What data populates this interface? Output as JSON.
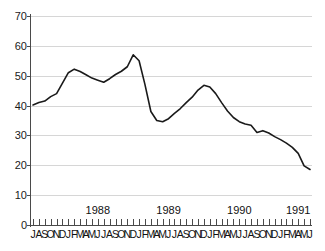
{
  "chart_data": {
    "type": "line",
    "title": "",
    "xlabel": "",
    "ylabel": "",
    "ylim": [
      0,
      70
    ],
    "yticks": [
      0,
      10,
      20,
      30,
      40,
      50,
      60,
      70
    ],
    "grid": true,
    "legend": "none",
    "line_color": "#1a1a1a",
    "gridline_color": "#d6d6d6",
    "axis_color": "#4a4a4a",
    "x": [
      "1987-07",
      "1987-08",
      "1987-09",
      "1987-10",
      "1987-11",
      "1987-12",
      "1988-01",
      "1988-02",
      "1988-03",
      "1988-04",
      "1988-05",
      "1988-06",
      "1988-07",
      "1988-08",
      "1988-09",
      "1988-10",
      "1988-11",
      "1988-12",
      "1989-01",
      "1989-02",
      "1989-03",
      "1989-04",
      "1989-05",
      "1989-06",
      "1989-07",
      "1989-08",
      "1989-09",
      "1989-10",
      "1989-11",
      "1989-12",
      "1990-01",
      "1990-02",
      "1990-03",
      "1990-04",
      "1990-05",
      "1990-06",
      "1990-07",
      "1990-08",
      "1990-09",
      "1990-10",
      "1990-11",
      "1990-12",
      "1991-01",
      "1991-02",
      "1991-03",
      "1991-04",
      "1991-05",
      "1991-06"
    ],
    "values": [
      40.2,
      41.0,
      41.5,
      43.0,
      44.0,
      47.5,
      51.0,
      52.2,
      51.4,
      50.3,
      49.2,
      48.5,
      47.8,
      49.0,
      50.4,
      51.5,
      53.0,
      57.0,
      55.0,
      47.0,
      38.0,
      35.0,
      34.6,
      35.6,
      37.4,
      39.0,
      41.0,
      42.8,
      45.2,
      46.8,
      46.2,
      44.0,
      41.0,
      38.2,
      36.0,
      34.6,
      33.8,
      33.4,
      31.0,
      31.6,
      30.8,
      29.6,
      28.6,
      27.4,
      26.0,
      24.0,
      19.8,
      18.6
    ],
    "month_letters": [
      "J",
      "A",
      "S",
      "O",
      "N",
      "D",
      "J",
      "F",
      "M",
      "A",
      "M",
      "J",
      "J",
      "A",
      "S",
      "O",
      "N",
      "D",
      "J",
      "F",
      "M",
      "A",
      "M",
      "J",
      "J",
      "A",
      "S",
      "O",
      "N",
      "D",
      "J",
      "F",
      "M",
      "A",
      "M",
      "J",
      "J",
      "A",
      "S",
      "O",
      "N",
      "D",
      "J",
      "F",
      "M",
      "A",
      "M",
      "J"
    ],
    "year_labels": [
      {
        "label": "1988",
        "center_index": 11
      },
      {
        "label": "1989",
        "center_index": 23
      },
      {
        "label": "1990",
        "center_index": 35
      },
      {
        "label": "1991",
        "center_index": 45
      }
    ]
  }
}
